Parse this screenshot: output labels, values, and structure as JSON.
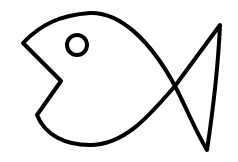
{
  "image": {
    "subject": "fish line drawing",
    "background": "#ffffff",
    "stroke": "#000000"
  }
}
